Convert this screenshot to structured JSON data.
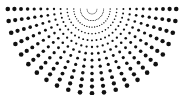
{
  "canvas": {
    "width": 184,
    "height": 95,
    "background_color": "#ffffff",
    "title": "Radial dot fan pattern"
  },
  "pattern": {
    "name": "radial-dot-fan",
    "description": "Halftone sunburst of black dots radiating downward from an apex near the top center; dot diameter increases with distance from the apex.",
    "dot_color": "#111111",
    "origin": {
      "x": 92.0,
      "y": 9.0
    },
    "ray_count": 23,
    "angle_start_deg": 0,
    "angle_end_deg": 180,
    "ring_count": 13,
    "radius_first": 5.0,
    "radius_step": 6.6,
    "dot_diameter_min": 0.7,
    "dot_diameter_max": 4.6,
    "clip_margin": 2,
    "symmetry": "mirror-vertical"
  },
  "chart_data": {
    "type": "scatter",
    "xlabel": "",
    "ylabel": "",
    "xlim": [
      0,
      184
    ],
    "ylim": [
      0,
      95
    ],
    "grid": false,
    "legend": "none",
    "polar_origin": {
      "x": 92.0,
      "y": 9.0
    },
    "angles_deg": [
      0,
      8.18,
      16.36,
      24.55,
      32.73,
      40.91,
      49.09,
      57.27,
      65.45,
      73.64,
      81.82,
      90,
      98.18,
      106.36,
      114.55,
      122.73,
      130.91,
      139.09,
      147.27,
      155.45,
      163.64,
      171.82,
      180
    ],
    "radii": [
      5.0,
      11.6,
      18.2,
      24.8,
      31.4,
      38.0,
      44.6,
      51.2,
      57.8,
      64.4,
      71.0,
      77.6,
      84.2
    ],
    "dot_sizes": [
      0.7,
      1.0,
      1.3,
      1.6,
      1.95,
      2.3,
      2.6,
      2.9,
      3.2,
      3.55,
      3.9,
      4.25,
      4.6
    ]
  }
}
